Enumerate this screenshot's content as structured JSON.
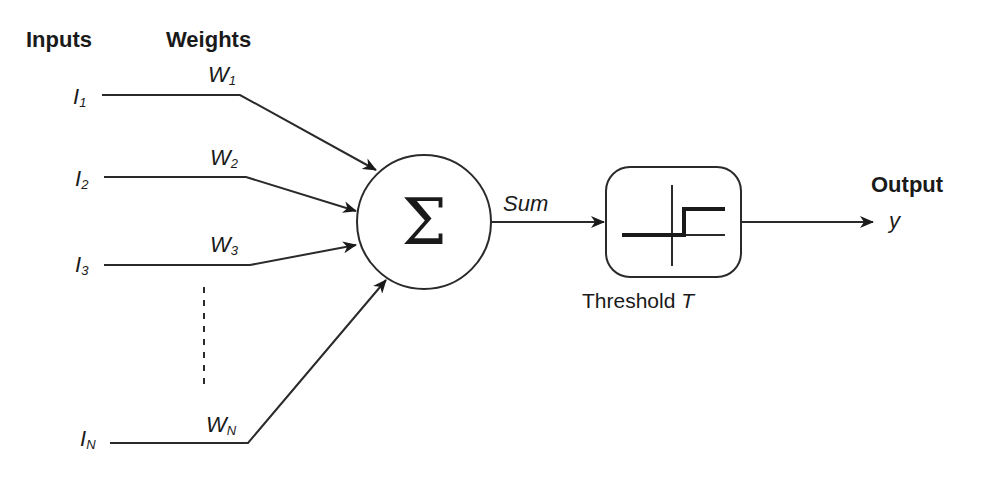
{
  "diagram": {
    "headers": {
      "inputs": "Inputs",
      "weights": "Weights",
      "output": "Output"
    },
    "inputs": [
      {
        "symbol": "I",
        "subscript": "1"
      },
      {
        "symbol": "I",
        "subscript": "2"
      },
      {
        "symbol": "I",
        "subscript": "3"
      },
      {
        "symbol": "I",
        "subscript": "N"
      }
    ],
    "weights": [
      {
        "symbol": "W",
        "subscript": "1"
      },
      {
        "symbol": "W",
        "subscript": "2"
      },
      {
        "symbol": "W",
        "subscript": "3"
      },
      {
        "symbol": "W",
        "subscript": "N"
      }
    ],
    "summation": {
      "symbol": "Σ",
      "edge_label": "Sum"
    },
    "activation": {
      "label_prefix": "Threshold ",
      "label_var": "T"
    },
    "output": {
      "symbol": "y"
    },
    "colors": {
      "stroke": "#2a2a2a",
      "text": "#1a1a1a",
      "background": "#ffffff"
    }
  }
}
